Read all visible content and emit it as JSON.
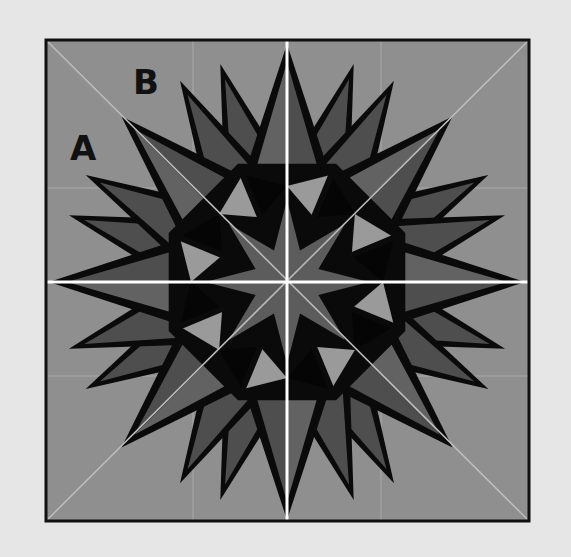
{
  "diagram": {
    "canvas": {
      "width": 571,
      "height": 557,
      "background": "#e6e6e6"
    },
    "frame": {
      "x": 46,
      "y": 40,
      "width": 483,
      "height": 481,
      "stroke": "#111111",
      "stroke_width": 3,
      "fill": "#8f8f8f"
    },
    "center": {
      "x": 287,
      "y": 282
    },
    "colors": {
      "background_panel": "#8f8f8f",
      "spike_outline": "#0a0a0a",
      "spike_dark": "#4e4e4e",
      "spike_mid": "#626262",
      "ring_light": "#9a9a9a",
      "ring_black": "#050505",
      "center_star": "#5c5c5c",
      "seam_white": "#ffffff",
      "seam_faint": "#bdbdbd"
    },
    "labels": [
      {
        "text": "B",
        "x": 133,
        "y": 65
      },
      {
        "text": "A",
        "x": 70,
        "y": 131
      }
    ],
    "seams": {
      "main_cross": [
        "horizontal",
        "vertical"
      ],
      "diagonals": true,
      "faint_verticals_x": [
        193,
        381
      ],
      "faint_horizontals_y": [
        188,
        376
      ]
    },
    "star": {
      "outer_points": 16,
      "outer_radius_axis": 236,
      "outer_radius_diag": 234,
      "inner_star_points": 8,
      "ring_kites": 8
    }
  }
}
